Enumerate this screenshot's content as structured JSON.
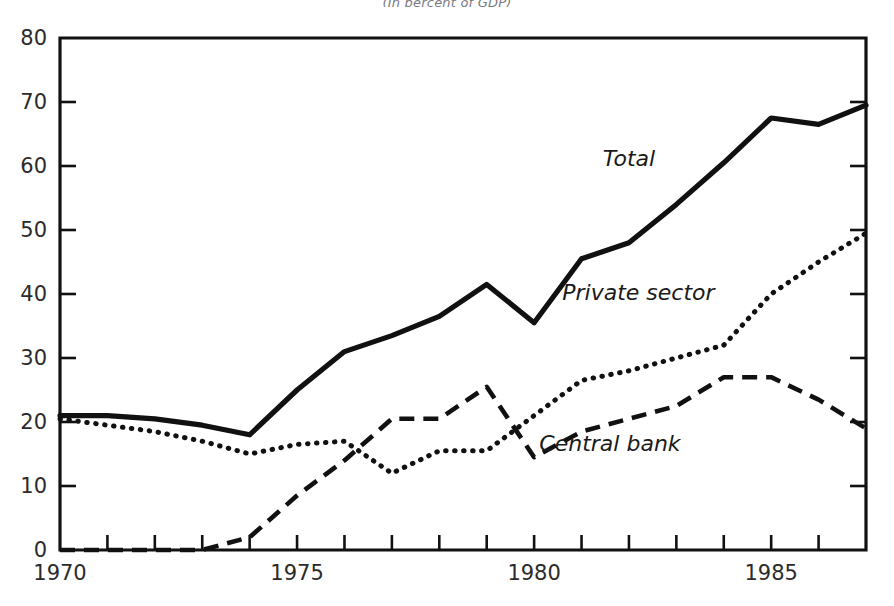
{
  "figure": {
    "title": "(In percent of GDP)"
  },
  "chart_data": {
    "type": "line",
    "title": "(In percent of GDP)",
    "xlabel": "",
    "ylabel": "",
    "xlim": [
      1970,
      1987
    ],
    "ylim": [
      0,
      80
    ],
    "grid": false,
    "legend_position": "inline-annotations",
    "x": [
      1970,
      1971,
      1972,
      1973,
      1974,
      1975,
      1976,
      1977,
      1978,
      1979,
      1980,
      1981,
      1982,
      1983,
      1984,
      1985,
      1986,
      1987
    ],
    "x_tick_labels": [
      "1970",
      "1975",
      "1980",
      "1985"
    ],
    "x_tick_values": [
      1970,
      1975,
      1980,
      1985
    ],
    "y_tick_labels": [
      "0",
      "10",
      "20",
      "30",
      "40",
      "50",
      "60",
      "70",
      "80"
    ],
    "y_tick_values": [
      0,
      10,
      20,
      30,
      40,
      50,
      60,
      70,
      80
    ],
    "series": [
      {
        "name": "Total",
        "line_style": "solid",
        "color": "#111111",
        "label_position": {
          "x": 1982.0,
          "y": 60.0
        },
        "values": [
          21.0,
          21.0,
          20.5,
          19.5,
          18.0,
          25.0,
          31.0,
          33.5,
          36.5,
          41.5,
          35.5,
          45.5,
          48.0,
          54.0,
          60.5,
          67.5,
          66.5,
          69.5
        ]
      },
      {
        "name": "Private sector",
        "line_style": "dotted",
        "color": "#111111",
        "label_position": {
          "x": 1982.2,
          "y": 39.0
        },
        "values": [
          20.5,
          19.5,
          18.5,
          17.0,
          15.0,
          16.5,
          17.0,
          12.0,
          15.5,
          15.5,
          21.0,
          26.5,
          28.0,
          30.0,
          32.0,
          40.0,
          45.0,
          49.5
        ]
      },
      {
        "name": "Central bank",
        "line_style": "dashed",
        "color": "#111111",
        "label_position": {
          "x": 1981.6,
          "y": 15.5
        },
        "values": [
          0.0,
          0.0,
          0.0,
          0.0,
          2.0,
          8.5,
          14.0,
          20.5,
          20.5,
          25.5,
          14.5,
          18.5,
          20.5,
          22.5,
          27.0,
          27.0,
          23.5,
          19.0
        ]
      }
    ]
  }
}
